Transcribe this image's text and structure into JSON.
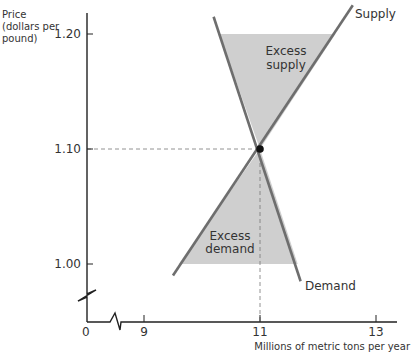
{
  "chart_data": {
    "type": "line",
    "title": "",
    "ylabel": [
      "Price",
      "(dollars per",
      "pound)"
    ],
    "xlabel": "Millions of metric tons per year",
    "x_ticks": [
      {
        "value": 9,
        "label": "9"
      },
      {
        "value": 11,
        "label": "11"
      },
      {
        "value": 13,
        "label": "13"
      }
    ],
    "y_ticks": [
      {
        "value": 1.0,
        "label": "1.00"
      },
      {
        "value": 1.1,
        "label": "1.10"
      },
      {
        "value": 1.2,
        "label": "1.20"
      }
    ],
    "origin_label": "0",
    "xlim": [
      8.0,
      14.0
    ],
    "ylim": [
      0.95,
      1.23
    ],
    "axis_break": true,
    "series": [
      {
        "name": "Supply",
        "label": "Supply",
        "points": [
          [
            9.5,
            0.99
          ],
          [
            12.6,
            1.225
          ]
        ]
      },
      {
        "name": "Demand",
        "label": "Demand",
        "points": [
          [
            10.2,
            1.215
          ],
          [
            11.7,
            0.985
          ]
        ]
      }
    ],
    "equilibrium": {
      "x": 11,
      "y": 1.1
    },
    "regions": [
      {
        "name": "excess-supply",
        "label": [
          "Excess",
          "supply"
        ],
        "price": 1.2,
        "qd": 10.3,
        "qs": 12.3
      },
      {
        "name": "excess-demand",
        "label": [
          "Excess",
          "demand"
        ],
        "price": 1.0,
        "qs": 9.6,
        "qd": 11.65
      }
    ],
    "colors": {
      "curve": "#6e6e6e",
      "fill": "#cfcfcf",
      "axis": "#222222",
      "text": "#333333"
    }
  }
}
